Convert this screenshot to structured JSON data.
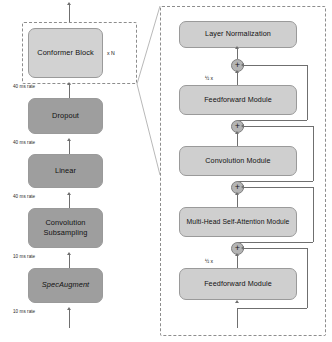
{
  "diagram": {
    "repeat_label": "x N",
    "half_label": "½ x",
    "plus_symbol": "+",
    "colors": {
      "light_fill": "#d2d2d2",
      "dark_fill": "#9e9e9e",
      "module_fill": "#cfcfcf",
      "junction_fill": "#b4b4b4",
      "stroke": "#9a9a9a",
      "line": "#6f6f6f",
      "dashed_border": "#8d8d8d",
      "background": "#ffffff"
    }
  },
  "left_column": {
    "blocks": [
      {
        "label": "Conformer Block",
        "style": "light"
      },
      {
        "label": "Dropout",
        "style": "dark"
      },
      {
        "label": "Linear",
        "style": "dark"
      },
      {
        "label": "Convolution\nSubsampling",
        "line1": "Convolution",
        "line2": "Subsampling",
        "style": "dark"
      },
      {
        "label": "SpecAugment",
        "style": "dark",
        "italic": true
      }
    ],
    "rates": [
      {
        "label": "40 ms rate"
      },
      {
        "label": "40 ms rate"
      },
      {
        "label": "40 ms rate"
      },
      {
        "label": "10 ms rate"
      },
      {
        "label": "10 ms rate"
      }
    ]
  },
  "right_panel": {
    "modules": [
      {
        "label": "Layer Normalization"
      },
      {
        "label": "Feedforward Module",
        "scale": "½ x"
      },
      {
        "label": "Convolution Module"
      },
      {
        "label": "Multi-Head Self-Attention Module"
      },
      {
        "label": "Feedforward Module",
        "scale": "½ x"
      }
    ],
    "junctions": [
      {
        "symbol": "+"
      },
      {
        "symbol": "+"
      },
      {
        "symbol": "+"
      },
      {
        "symbol": "+"
      }
    ]
  }
}
